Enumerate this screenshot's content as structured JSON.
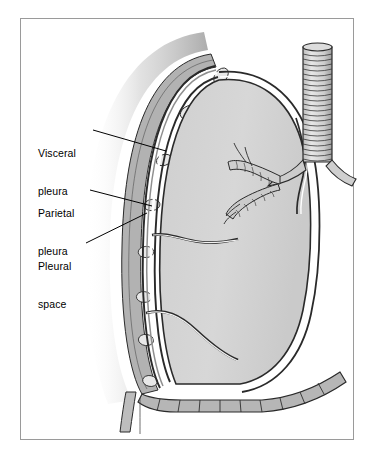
{
  "figure": {
    "kind": "anatomical-illustration",
    "border_color": "#9a9a9a",
    "background_color": "#ffffff"
  },
  "labels": [
    {
      "id": "visceral-pleura",
      "line1": "Visceral",
      "line2": "pleura",
      "text": "Visceral pleura",
      "leader": {
        "x1": 93,
        "y1": 130,
        "x2": 166,
        "y2": 151
      }
    },
    {
      "id": "parietal-pleura",
      "line1": "Parietal",
      "line2": "pleura",
      "text": "Parietal pleura",
      "leader": {
        "x1": 90,
        "y1": 190,
        "x2": 152,
        "y2": 206
      }
    },
    {
      "id": "pleural-space",
      "line1": "Pleural",
      "line2": "space",
      "text": "Pleural space",
      "leader": {
        "x1": 86,
        "y1": 243,
        "x2": 147,
        "y2": 213
      }
    }
  ],
  "structures": [
    {
      "name": "trachea",
      "note": "vertical airway with cartilage rings",
      "rings": 26
    },
    {
      "name": "bronchial-tree",
      "note": "branching bronchi with cartilage segments"
    },
    {
      "name": "lung",
      "fill": "#d5d5d5",
      "note": "lung parenchyma body"
    },
    {
      "name": "visceral-pleura",
      "fill": "#8d8d8d",
      "note": "membrane on lung surface"
    },
    {
      "name": "pleural-space",
      "fill": "#ffffff",
      "note": "white gap between membranes"
    },
    {
      "name": "parietal-pleura",
      "fill": "#8d8d8d",
      "note": "membrane lining chest wall"
    },
    {
      "name": "chest-wall",
      "fill": "#b0b0b0",
      "note": "thoracic wall band"
    },
    {
      "name": "ribs",
      "fill": "#e4e4e4",
      "count": 9,
      "note": "rib cross-sections"
    },
    {
      "name": "horizontal-fissure",
      "note": "upper fissure of lung"
    },
    {
      "name": "oblique-fissure",
      "note": "lower fissure of lung"
    },
    {
      "name": "diaphragm",
      "fill": "#b4b4b4",
      "note": "segmented muscle sheet at base"
    },
    {
      "name": "soft-tissue-shadow",
      "note": "gradient shading outside chest wall"
    }
  ],
  "colors": {
    "ink": "#1a1a1a",
    "lung_fill": "#d5d5d5",
    "pleura": "#8d8d8d",
    "chest_wall": "#b0b0b0",
    "rib": "#e4e4e4",
    "diaphragm": "#b4b4b4",
    "space_white": "#ffffff",
    "frame": "#9a9a9a"
  }
}
